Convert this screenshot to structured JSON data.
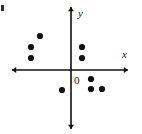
{
  "chart_data": {
    "type": "scatter",
    "title": "",
    "subtitle": "",
    "xlabel": "x",
    "ylabel": "y",
    "origin_label": "0",
    "grid": false,
    "legend": null,
    "xlim": [
      -70,
      72
    ],
    "ylim": [
      -62,
      66
    ],
    "axes": {
      "origin_px": {
        "x": 71,
        "y": 70
      },
      "x_axis_px": {
        "x1": 12,
        "x2": 128,
        "y": 70
      },
      "y_axis_px": {
        "x": 71,
        "y1": 7,
        "y2": 129
      },
      "x_arrow": "both",
      "y_arrow": "both"
    },
    "point_radius_px": 3.1,
    "points": [
      {
        "label": "p1",
        "px": {
          "x": 40,
          "y": 36
        },
        "quadrant": "II"
      },
      {
        "label": "p2",
        "px": {
          "x": 31,
          "y": 47
        },
        "quadrant": "II"
      },
      {
        "label": "p3",
        "px": {
          "x": 31,
          "y": 58
        },
        "quadrant": "II"
      },
      {
        "label": "p4",
        "px": {
          "x": 82,
          "y": 47
        },
        "quadrant": "I"
      },
      {
        "label": "p5",
        "px": {
          "x": 82,
          "y": 58
        },
        "quadrant": "I"
      },
      {
        "label": "p6",
        "px": {
          "x": 91,
          "y": 79
        },
        "quadrant": "IV"
      },
      {
        "label": "p7",
        "px": {
          "x": 62,
          "y": 90
        },
        "quadrant": "III"
      },
      {
        "label": "p8",
        "px": {
          "x": 91,
          "y": 89
        },
        "quadrant": "IV"
      },
      {
        "label": "p9",
        "px": {
          "x": 102,
          "y": 89
        },
        "quadrant": "IV"
      }
    ],
    "x": [
      -31,
      -40,
      -40,
      11,
      11,
      20,
      -9,
      20,
      31
    ],
    "y": [
      34,
      23,
      12,
      23,
      12,
      -9,
      -20,
      -19,
      -19
    ],
    "colors": {
      "point": "#101010",
      "axis": "#101010",
      "background": "#ffffff",
      "text": "#111111"
    },
    "annotations": [
      {
        "name": "corner-mark",
        "px": {
          "x": 2,
          "y": 8
        }
      }
    ]
  }
}
